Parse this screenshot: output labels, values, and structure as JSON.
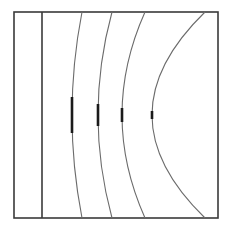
{
  "figure": {
    "background_color": "#ffffff",
    "stroke_color": "#3a3a3a",
    "curve_color": "#6b6b6b",
    "tick_color": "#1a1a1a",
    "width": 234,
    "height": 231
  },
  "frame": {
    "name": "outer-rectangle",
    "left": 14,
    "top": 12,
    "right": 218,
    "bottom": 218,
    "stroke_width": 1.6
  },
  "vertical_line": {
    "name": "source-plane-line",
    "x": 42,
    "y_top": 12,
    "y_bottom": 218,
    "stroke_width": 1.6
  },
  "chart_data": {
    "type": "line",
    "xlabel": "",
    "ylabel": "",
    "xlim": [
      14,
      218
    ],
    "ylim": [
      12,
      218
    ],
    "grid": false,
    "legend": null,
    "series": [
      {
        "name": "wavefront-1",
        "x_top": 82,
        "x_bottom": 82,
        "x_apex": 72,
        "y_apex": 115,
        "tick_half_length": 18,
        "tick_x": 72
      },
      {
        "name": "wavefront-2",
        "x_top": 112,
        "x_bottom": 112,
        "x_apex": 98,
        "y_apex": 115,
        "tick_half_length": 11,
        "tick_x": 98
      },
      {
        "name": "wavefront-3",
        "x_top": 145,
        "x_bottom": 145,
        "x_apex": 122,
        "y_apex": 115,
        "tick_half_length": 7,
        "tick_x": 122
      },
      {
        "name": "wavefront-4",
        "x_top": 205,
        "x_bottom": 205,
        "x_apex": 152,
        "y_apex": 115,
        "tick_half_length": 4,
        "tick_x": 152
      }
    ]
  }
}
